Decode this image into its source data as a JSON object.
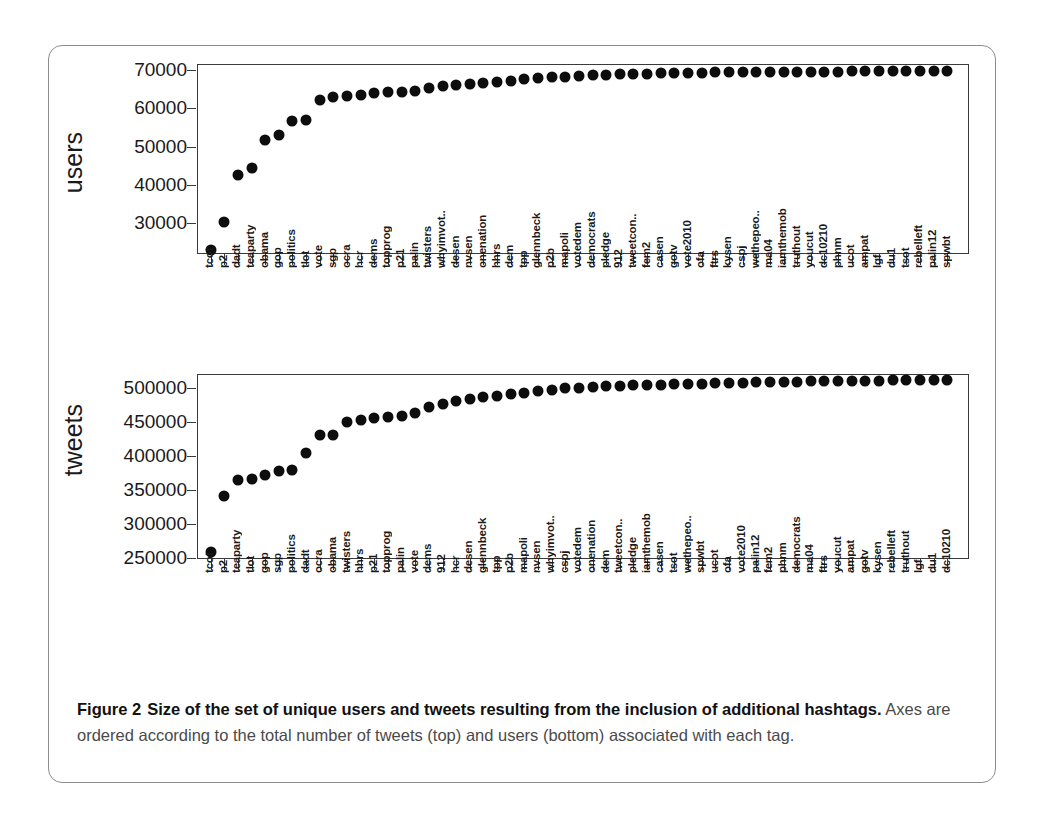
{
  "figure": {
    "label": "Figure 2",
    "title_bold": "Size of the set of unique users and tweets resulting from the inclusion of additional hashtags.",
    "body": "Axes are ordered according to the total number of tweets (top) and users (bottom) associated with each tag."
  },
  "chart_data": [
    {
      "type": "scatter",
      "id": "users-panel",
      "title": "",
      "xlabel": "",
      "ylabel": "users",
      "ylim": [
        22000,
        71500
      ],
      "yticks": [
        30000,
        40000,
        50000,
        60000,
        70000
      ],
      "ytick_labels": [
        "30000",
        "40000",
        "50000",
        "60000",
        "70000"
      ],
      "grid": false,
      "legend": "none",
      "categories": [
        "tcot",
        "p2",
        "dadt",
        "teaparty",
        "obama",
        "gop",
        "politics",
        "tlot",
        "vote",
        "sgp",
        "ocra",
        "hcr",
        "dems",
        "topprog",
        "p21",
        "palin",
        "twisters",
        "whyimvot..",
        "desen",
        "nvsen",
        "onenation",
        "hhrs",
        "dem",
        "tpp",
        "glennbeck",
        "p2b",
        "mapoli",
        "votedem",
        "democrats",
        "pledge",
        "912",
        "tweetcon..",
        "fem2",
        "casen",
        "gotv",
        "vote2010",
        "ofa",
        "ftrs",
        "kysen",
        "cspj",
        "wethepeo..",
        "ma04",
        "iamthemob",
        "truthout",
        "youcut",
        "dc10210",
        "phnm",
        "ucot",
        "ampat",
        "lgf",
        "du1",
        "tsot",
        "rebelleft",
        "palin12",
        "spwbt"
      ],
      "values": [
        23000,
        30400,
        42700,
        44300,
        51600,
        52900,
        56700,
        57000,
        62100,
        62800,
        63100,
        63500,
        64000,
        64100,
        64300,
        64500,
        65300,
        65700,
        66000,
        66300,
        66600,
        66900,
        67200,
        67600,
        67800,
        68000,
        68200,
        68400,
        68600,
        68700,
        68800,
        68900,
        69000,
        69100,
        69150,
        69200,
        69250,
        69300,
        69350,
        69400,
        69420,
        69440,
        69460,
        69480,
        69500,
        69520,
        69540,
        69550,
        69560,
        69570,
        69580,
        69590,
        69600,
        69610,
        69620
      ]
    },
    {
      "type": "scatter",
      "id": "tweets-panel",
      "title": "",
      "xlabel": "",
      "ylabel": "tweets",
      "ylim": [
        248000,
        520000
      ],
      "yticks": [
        250000,
        300000,
        350000,
        400000,
        450000,
        500000
      ],
      "ytick_labels": [
        "250000",
        "300000",
        "350000",
        "400000",
        "450000",
        "500000"
      ],
      "grid": false,
      "legend": "none",
      "categories": [
        "tcot",
        "p2",
        "teaparty",
        "tlot",
        "gop",
        "sgp",
        "politics",
        "dadt",
        "ocra",
        "obama",
        "twisters",
        "hhrs",
        "p21",
        "topprog",
        "palin",
        "vote",
        "dems",
        "912",
        "hcr",
        "desen",
        "glennbeck",
        "tpp",
        "p2b",
        "mapoli",
        "nvsen",
        "whyimvot..",
        "cspj",
        "votedem",
        "onenation",
        "dem",
        "tweetcon..",
        "pledge",
        "iamthemob",
        "casen",
        "tsot",
        "wethepeo..",
        "spwbt",
        "ucot",
        "ofa",
        "vote2010",
        "palin12",
        "fem2",
        "phnm",
        "democrats",
        "ma04",
        "ftrs",
        "youcut",
        "ampat",
        "gotv",
        "kysen",
        "rebelleft",
        "truthout",
        "lgf",
        "du1",
        "dc10210"
      ],
      "values": [
        259000,
        341000,
        364000,
        366000,
        372000,
        378000,
        379000,
        404000,
        430000,
        430000,
        449000,
        452000,
        455000,
        457000,
        458000,
        462000,
        472000,
        476000,
        480000,
        483000,
        486000,
        488000,
        490000,
        492000,
        495000,
        497000,
        499000,
        500000,
        501000,
        502000,
        503000,
        503500,
        504000,
        504500,
        505000,
        505500,
        506000,
        506500,
        507000,
        507500,
        508000,
        508300,
        508600,
        508900,
        509200,
        509500,
        509700,
        509900,
        510100,
        510300,
        510500,
        510700,
        510900,
        511100,
        511300
      ]
    }
  ]
}
